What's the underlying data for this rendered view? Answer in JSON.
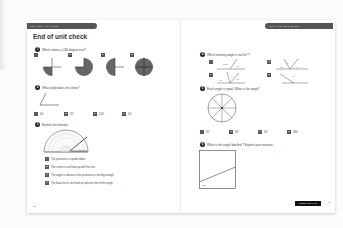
{
  "page": {
    "title": "End of unit check",
    "left_header": "Unit 6: Angles – Unit 6: Revision",
    "right_header": "Unit 6: Angles – End of unit check",
    "left_page_number": "88",
    "right_page_number": "89",
    "footer_button": "Practice book 4A p8"
  },
  "questions": [
    {
      "number": "1",
      "text": "Which shows a 180 degree turn?",
      "options": [
        {
          "letter": "A",
          "shape": "quarter-turn"
        },
        {
          "letter": "B",
          "shape": "three-quarter-turn"
        },
        {
          "letter": "C",
          "shape": "half-turn"
        },
        {
          "letter": "D",
          "shape": "full-turn"
        }
      ]
    },
    {
      "number": "2",
      "text": "What angle does this show?",
      "options": [
        {
          "letter": "A",
          "label": "60°"
        },
        {
          "letter": "B",
          "label": "45°"
        },
        {
          "letter": "C",
          "label": "120°"
        },
        {
          "letter": "D",
          "label": "20°"
        }
      ]
    },
    {
      "number": "3",
      "text": "Explain the mistake.",
      "options": [
        {
          "letter": "A",
          "label": "The protractor is upside down."
        },
        {
          "letter": "B",
          "label": "The centre is not lined up with the turn."
        },
        {
          "letter": "C",
          "label": "The angle is obtuse so the protractor is not big enough."
        },
        {
          "letter": "D",
          "label": "The base line is not lined up with one line of the angle."
        }
      ]
    },
    {
      "number": "4",
      "text": "Which missing angle is not 50°?",
      "options": [
        {
          "letter": "A",
          "labels": [
            "130°",
            "?"
          ]
        },
        {
          "letter": "B",
          "labels": [
            "?",
            "90°",
            "40°"
          ]
        },
        {
          "letter": "C",
          "labels": [
            "40°",
            "?",
            "90°"
          ]
        },
        {
          "letter": "D",
          "labels": [
            "?"
          ]
        }
      ]
    },
    {
      "number": "5",
      "text": "Each angle is equal. What is the angle?",
      "options": [
        {
          "letter": "A",
          "label": "45°"
        },
        {
          "letter": "B",
          "label": "30°"
        },
        {
          "letter": "C",
          "label": "90°"
        },
        {
          "letter": "D",
          "label": "360°"
        }
      ]
    },
    {
      "number": "6",
      "text": "What is the angle labelled ​? Explain your reasons.",
      "labels": [
        "?",
        "22°"
      ]
    }
  ]
}
